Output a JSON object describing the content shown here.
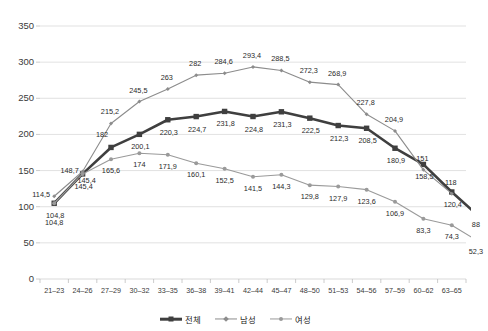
{
  "chart_data": {
    "type": "line",
    "title": "",
    "xlabel": "",
    "ylabel": "",
    "ylim": [
      0,
      350
    ],
    "yticks": [
      0,
      50,
      100,
      150,
      200,
      250,
      300,
      350
    ],
    "grid": true,
    "legend_position": "bottom",
    "categories": [
      "21-23",
      "24-26",
      "27-29",
      "30-32",
      "33-35",
      "36-38",
      "39-41",
      "42-44",
      "45-47",
      "48-50",
      "51-53",
      "54-56",
      "57-59",
      "60-62",
      "63-65"
    ],
    "series": [
      {
        "name": "전체",
        "color": "#3f3f3f",
        "marker": "square",
        "width": 2.6,
        "values": [
          104.8,
          145.4,
          182,
          200.1,
          220.3,
          224.7,
          231.8,
          224.8,
          231.3,
          222.5,
          212.3,
          208.5,
          180.9,
          158.5,
          120.4
        ],
        "labels": [
          "104,8",
          "145,4",
          "182",
          "200,1",
          "220,3",
          "224,7",
          "231,8",
          "224,8",
          "231,3",
          "222,5",
          "212,3",
          "208,5",
          "180,9",
          "158,5",
          "120,4"
        ],
        "end_label": "88",
        "end_value": 88
      },
      {
        "name": "남성",
        "color": "#8c8c8c",
        "marker": "diamond",
        "width": 1.1,
        "values": [
          114.5,
          148.7,
          215.2,
          245.5,
          263,
          282,
          284.6,
          293.4,
          288.5,
          272.3,
          268.9,
          227.8,
          204.9,
          151,
          118
        ],
        "labels": [
          "114,5",
          "148,7",
          "215,2",
          "245,5",
          "263",
          "282",
          "284,6",
          "293,4",
          "288,5",
          "272,3",
          "268,9",
          "227,8",
          "204,9",
          "151",
          "118"
        ]
      },
      {
        "name": "여성",
        "color": "#9a9a9a",
        "marker": "circle",
        "width": 1.1,
        "values": [
          104.8,
          145.4,
          165.6,
          174,
          171.9,
          160.1,
          152.5,
          141.5,
          144.3,
          129.8,
          127.9,
          123.6,
          106.9,
          83.3,
          74.3
        ],
        "labels": [
          "104,8",
          "145,4",
          "165,6",
          "174",
          "171,9",
          "160,1",
          "152,5",
          "141,5",
          "144,3",
          "129,8",
          "127,9",
          "123,6",
          "106,9",
          "83,3",
          "74,3"
        ],
        "end_label": "52,3",
        "end_value": 52.3
      }
    ]
  },
  "axis": {
    "y_tick_labels": [
      "350",
      "300",
      "250",
      "200",
      "150",
      "100",
      "50",
      "0"
    ]
  },
  "legend": {
    "items": [
      {
        "label": "전체",
        "color": "#3f3f3f",
        "marker": "square",
        "width": 2.6
      },
      {
        "label": "남성",
        "color": "#8c8c8c",
        "marker": "diamond",
        "width": 1.1
      },
      {
        "label": "여성",
        "color": "#9a9a9a",
        "marker": "circle",
        "width": 1.1
      }
    ]
  },
  "colors": {
    "grid": "#d9d9d9",
    "axis": "#bfbfbf",
    "text": "#333333",
    "background": "#ffffff"
  }
}
